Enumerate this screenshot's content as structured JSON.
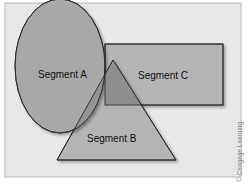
{
  "diagram": {
    "segments": [
      {
        "id": "A",
        "label": "Segment A",
        "shape": "ellipse"
      },
      {
        "id": "B",
        "label": "Segment B",
        "shape": "triangle"
      },
      {
        "id": "C",
        "label": "Segment C",
        "shape": "rectangle"
      }
    ],
    "credit": "© Cengage Learning",
    "colors": {
      "frame_fill": "#e8e8e8",
      "shape_fill": "#b4b4b4",
      "overlap_fill": "#8c8c8c",
      "stroke": "#2a2a2a"
    }
  }
}
